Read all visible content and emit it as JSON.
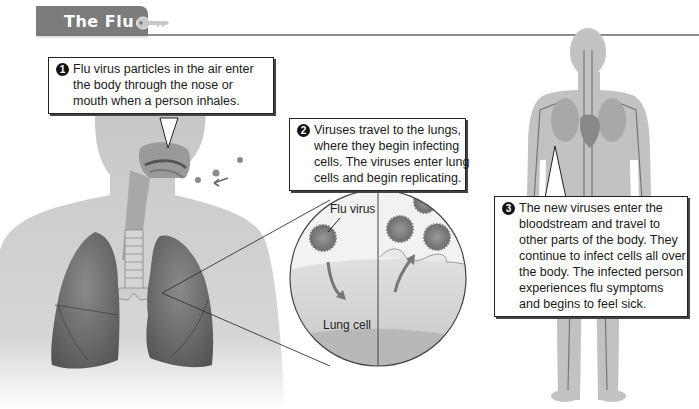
{
  "header": {
    "title": "The Flu",
    "icon": "key-icon"
  },
  "steps": [
    {
      "number": "1",
      "lines": [
        "Flu virus particles in the air enter",
        "the body through the nose or",
        "mouth when a person inhales."
      ]
    },
    {
      "number": "2",
      "lines": [
        "Viruses travel to the lungs,",
        "where they begin infecting",
        "cells. The viruses enter lung",
        "cells and begin replicating."
      ]
    },
    {
      "number": "3",
      "lines": [
        "The new viruses enter the",
        "bloodstream and travel to",
        "other parts of the body. They",
        "continue to infect cells all over",
        "the body. The infected person",
        "experiences flu symptoms",
        "and begins to feel sick."
      ]
    }
  ],
  "labels": {
    "flu_virus": "Flu virus",
    "lung_cell": "Lung cell"
  },
  "colors": {
    "header_bg": "#7b7b7b",
    "rule": "#8d8d8d",
    "body": "#c9c9c9",
    "lung": "#6e6e6e",
    "virus": "#8a8a8a"
  }
}
